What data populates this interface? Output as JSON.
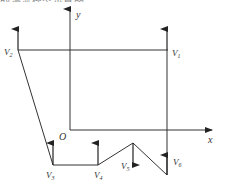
{
  "header": {
    "cut_off_text": "的漂流模型示意图"
  },
  "diagram": {
    "axes": {
      "x_label": "x",
      "y_label": "y",
      "origin_label": "O"
    },
    "vertices": [
      {
        "name": "V1",
        "sub": "1",
        "x": 168,
        "y": 50
      },
      {
        "name": "V2",
        "sub": "2",
        "x": 18,
        "y": 50
      },
      {
        "name": "V3",
        "sub": "3",
        "x": 53,
        "y": 165
      },
      {
        "name": "V4",
        "sub": "4",
        "x": 98,
        "y": 165
      },
      {
        "name": "V5",
        "sub": "5",
        "x": 133,
        "y": 143
      },
      {
        "name": "V6",
        "sub": "6",
        "x": 167,
        "y": 175
      }
    ],
    "labels": {
      "V1": "V",
      "V2": "V",
      "V3": "V",
      "V4": "V",
      "V5": "V",
      "V6": "V",
      "s1": "1",
      "s2": "2",
      "s3": "3",
      "s4": "4",
      "s5": "5",
      "s6": "6"
    },
    "colors": {
      "line": "#333333",
      "text": "#333333"
    }
  }
}
